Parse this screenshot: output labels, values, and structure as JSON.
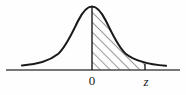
{
  "figure": {
    "name": "standard-normal-distribution-shaded-area",
    "background_color": "#fefefe",
    "stroke_color": "#1a1a1a",
    "hatch_color": "#3a3a3a",
    "axis_color": "#4a4a4a"
  },
  "axis": {
    "x_start": 6,
    "x_end": 180,
    "y": 70,
    "tick_labels": [
      {
        "id": "zero",
        "text": "0",
        "x": 92,
        "italic": false
      },
      {
        "id": "z",
        "text": "z",
        "x": 146,
        "italic": true
      }
    ]
  },
  "curve": {
    "peak_x": 92,
    "peak_y": 6,
    "baseline_y": 70,
    "left_tail_x": 22,
    "right_tail_x": 166,
    "path": "M 22,65.5 C 36,64.5 48,62 58,54 C 66,47 72,33 78,21 C 83,11 87,6.5 92,6.5 C 97,6.5 101,11 106,21 C 112,33 118,47 126,54 C 136,62 150,64.5 166,65.8"
  },
  "shaded_region": {
    "from_label": "0",
    "to_label": "z",
    "left_x": 92,
    "right_x": 145,
    "hatch_angle_degrees": 45,
    "hatch_spacing_px": 7,
    "path": "M 92,70 L 92,6.5 C 97,6.5 101,11 106,21 C 112,33 118,47 126,54 C 132,58.5 138,61.5 145,63.4 L 145,70 Z"
  },
  "vertical_lines": [
    {
      "id": "center-line-at-zero",
      "x": 92,
      "y_top": 6.5,
      "y_bottom": 70
    },
    {
      "id": "boundary-line-at-z",
      "x": 145,
      "y_top": 63.4,
      "y_bottom": 70
    }
  ]
}
